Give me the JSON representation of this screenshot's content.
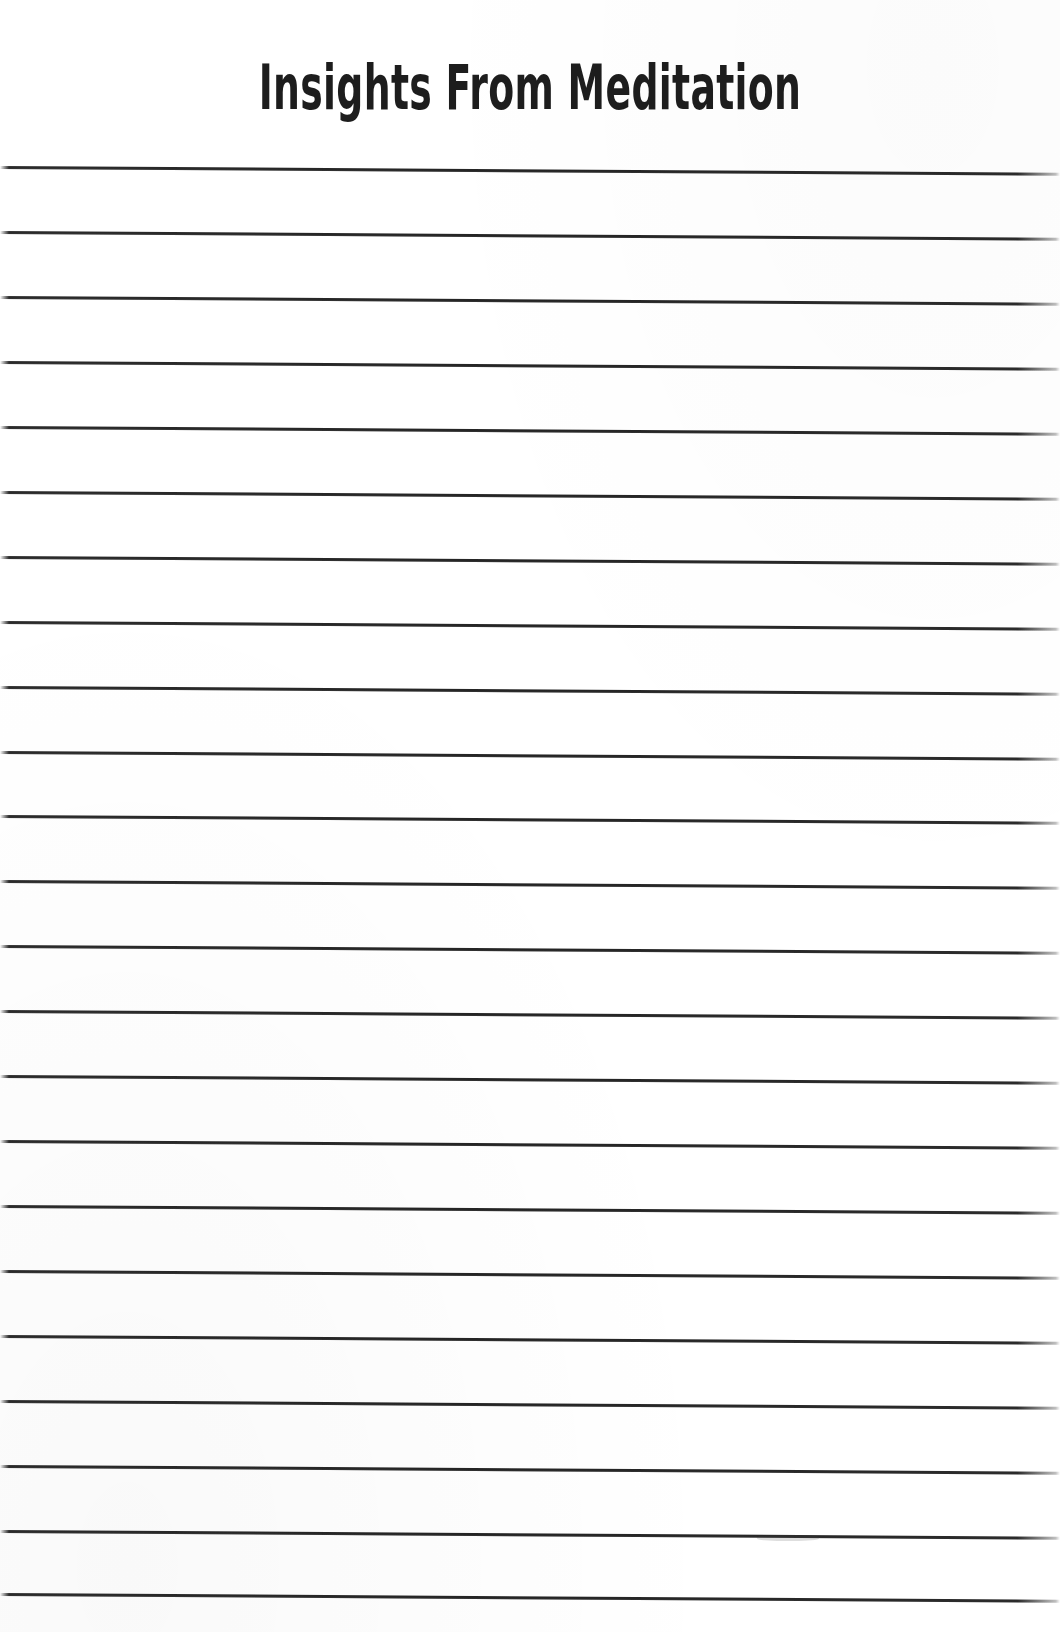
{
  "document": {
    "kind": "lined-journal-page",
    "title": "Insights From Meditation",
    "background_color": "#ffffff",
    "ink_color": "#242424",
    "width": 1060,
    "height": 1632
  },
  "header": {
    "title": "Insights From Meditation"
  },
  "ruled_area": {
    "label": "Ruled writing lines",
    "line_count": 23,
    "first_line_y": 167,
    "line_spacing": 64.9,
    "line_thickness": 3,
    "line_color": "#242424",
    "left_edge": 0,
    "right_edge": 1060,
    "skew_degrees": 0.36,
    "lines": [
      {
        "index": 1,
        "y": 167,
        "content": ""
      },
      {
        "index": 2,
        "y": 232,
        "content": ""
      },
      {
        "index": 3,
        "y": 297,
        "content": ""
      },
      {
        "index": 4,
        "y": 362,
        "content": ""
      },
      {
        "index": 5,
        "y": 427,
        "content": ""
      },
      {
        "index": 6,
        "y": 492,
        "content": ""
      },
      {
        "index": 7,
        "y": 557,
        "content": ""
      },
      {
        "index": 8,
        "y": 622,
        "content": ""
      },
      {
        "index": 9,
        "y": 687,
        "content": ""
      },
      {
        "index": 10,
        "y": 752,
        "content": ""
      },
      {
        "index": 11,
        "y": 816,
        "content": ""
      },
      {
        "index": 12,
        "y": 881,
        "content": ""
      },
      {
        "index": 13,
        "y": 946,
        "content": ""
      },
      {
        "index": 14,
        "y": 1011,
        "content": ""
      },
      {
        "index": 15,
        "y": 1076,
        "content": ""
      },
      {
        "index": 16,
        "y": 1141,
        "content": ""
      },
      {
        "index": 17,
        "y": 1206,
        "content": ""
      },
      {
        "index": 18,
        "y": 1271,
        "content": ""
      },
      {
        "index": 19,
        "y": 1336,
        "content": ""
      },
      {
        "index": 20,
        "y": 1401,
        "content": ""
      },
      {
        "index": 21,
        "y": 1466,
        "content": ""
      },
      {
        "index": 22,
        "y": 1531,
        "content": ""
      },
      {
        "index": 23,
        "y": 1594,
        "content": ""
      }
    ]
  },
  "artifacts": [
    {
      "name": "scan-smudge",
      "x": 757,
      "y": 1535,
      "width": 62,
      "height": 6
    }
  ]
}
